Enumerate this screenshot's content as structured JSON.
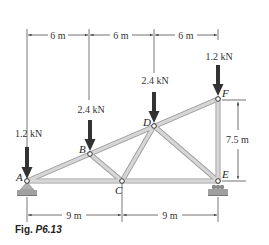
{
  "figure": {
    "caption_prefix": "Fig.",
    "caption_number": "P6.13"
  },
  "dimensions": {
    "top": [
      "6 m",
      "6 m",
      "6 m"
    ],
    "bottom": [
      "9 m",
      "9 m"
    ],
    "right": "7.5 m"
  },
  "loads": [
    {
      "joint": "A",
      "label": "1.2 kN"
    },
    {
      "joint": "B",
      "label": "2.4 kN"
    },
    {
      "joint": "D",
      "label": "2.4 kN"
    },
    {
      "joint": "F",
      "label": "1.2 kN"
    }
  ],
  "joints": {
    "A": "A",
    "B": "B",
    "C": "C",
    "D": "D",
    "E": "E",
    "F": "F"
  },
  "colors": {
    "member_fill": "#cfcfcf",
    "member_stroke": "#9a9a9a",
    "arrow": "#333333",
    "support": "#9c9c9c",
    "line": "#444444"
  }
}
